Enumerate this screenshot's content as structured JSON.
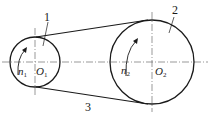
{
  "diagram": {
    "type": "belt-drive",
    "small_pulley": {
      "part_number": "1",
      "center_label": "O",
      "center_sub": "1",
      "speed_label": "n",
      "speed_sub": "1",
      "cx": 35,
      "cy": 62,
      "r": 25
    },
    "large_pulley": {
      "part_number": "2",
      "center_label": "O",
      "center_sub": "2",
      "speed_label": "n",
      "speed_sub": "2",
      "cx": 152,
      "cy": 62,
      "r": 42
    },
    "belt": {
      "part_number": "3"
    },
    "colors": {
      "stroke": "#1a1a1a",
      "background": "#ffffff"
    }
  }
}
